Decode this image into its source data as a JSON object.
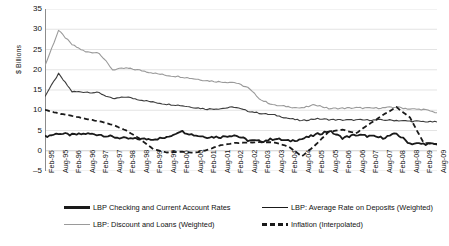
{
  "chart_data": {
    "type": "line",
    "title": "",
    "xlabel": "",
    "ylabel": "$ Billions",
    "ylim": [
      -5,
      35
    ],
    "ytick_step": 5,
    "yticks": [
      "35",
      "30",
      "25",
      "20",
      "15",
      "10",
      "5",
      "0",
      "-5"
    ],
    "grid": "horizontal",
    "legend_position": "bottom",
    "colors": {
      "checking": "#1a1a1a",
      "deposits": "#3c3c3c",
      "discount_loans": "#9a9a9a",
      "inflation": "#1a1a1a"
    },
    "categories": [
      "Feb-95",
      "Aug-95",
      "Feb-96",
      "Aug-96",
      "Feb-97",
      "Aug-97",
      "Feb-98",
      "Aug-98",
      "Feb-99",
      "Aug-99",
      "Feb-00",
      "Aug-00",
      "Feb-01",
      "Aug-01",
      "Feb-02",
      "Aug-02",
      "Feb-03",
      "Aug-03",
      "Feb-04",
      "Aug-04",
      "Feb-05",
      "Aug-05",
      "Feb-06",
      "Aug-06",
      "Feb-07",
      "Aug-07",
      "Feb-08",
      "Aug-08",
      "Feb-09",
      "Aug-09"
    ],
    "series": [
      {
        "name": "LBP Checking and Current Account Rates",
        "style": "solid-thick",
        "color": "#1a1a1a",
        "values": [
          3.5,
          4.3,
          3.9,
          4.2,
          4.0,
          3.4,
          3.0,
          2.9,
          2.9,
          3.2,
          4.9,
          3.9,
          3.4,
          3.4,
          3.9,
          2.6,
          2.3,
          3.0,
          2.4,
          2.9,
          3.9,
          4.9,
          3.2,
          3.9,
          3.6,
          3.2,
          4.2,
          1.8,
          1.7,
          1.6
        ]
      },
      {
        "name": "LBP: Average Rate on Deposits (Weighted)",
        "style": "solid-thin",
        "color": "#3c3c3c",
        "values": [
          13.5,
          19.0,
          14.6,
          14.5,
          14.3,
          12.8,
          13.3,
          12.6,
          12.0,
          11.5,
          11.2,
          10.7,
          10.3,
          10.4,
          10.8,
          9.8,
          9.2,
          8.8,
          8.0,
          7.4,
          7.9,
          7.7,
          7.6,
          7.6,
          7.6,
          7.6,
          7.5,
          7.3,
          7.2,
          7.1
        ]
      },
      {
        "name": "LBP: Discount and Loans (Weighted)",
        "style": "solid-gray",
        "color": "#9a9a9a",
        "values": [
          21.0,
          29.7,
          26.2,
          24.4,
          24.2,
          20.0,
          20.4,
          19.9,
          19.2,
          18.6,
          18.3,
          17.8,
          17.3,
          17.0,
          16.9,
          15.6,
          12.5,
          11.2,
          10.9,
          10.5,
          11.4,
          10.4,
          10.5,
          10.6,
          10.5,
          10.6,
          10.8,
          10.3,
          10.2,
          9.4
        ]
      },
      {
        "name": "Inflation (Interpolated)",
        "style": "dashed",
        "color": "#1a1a1a",
        "values": [
          10.1,
          9.2,
          8.6,
          7.9,
          7.3,
          6.4,
          5.0,
          3.0,
          0.4,
          -0.4,
          -0.2,
          -0.5,
          0.2,
          1.4,
          1.9,
          2.0,
          2.2,
          2.0,
          1.1,
          -1.4,
          1.4,
          4.7,
          5.2,
          4.3,
          6.6,
          8.8,
          10.8,
          8.2,
          2.0,
          1.6
        ]
      }
    ]
  },
  "legend": {
    "items": [
      {
        "label": "LBP Checking and Current Account Rates"
      },
      {
        "label": "LBP: Average Rate on Deposits (Weighted)"
      },
      {
        "label": "LBP: Discount and Loans (Weighted)"
      },
      {
        "label": "Inflation (Interpolated)"
      }
    ]
  }
}
